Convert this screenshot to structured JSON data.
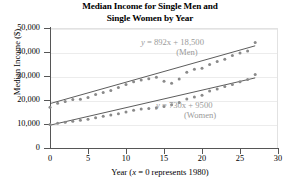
{
  "chart_data": {
    "type": "scatter",
    "title": "Median Income for Single Men and Single Women by Year",
    "title_line1": "Median Income for Single Men and",
    "title_line2": "Single Women by Year",
    "xlabel_prefix": "Year (",
    "xlabel_var": "x",
    "xlabel_suffix": " = 0 represents 1980)",
    "ylabel": "Median Income ($)",
    "xlim": [
      0,
      30
    ],
    "ylim": [
      0,
      50000
    ],
    "xticks": [
      0,
      5,
      10,
      15,
      20,
      25,
      30
    ],
    "xtick_labels": [
      "0",
      "5",
      "10",
      "15",
      "20",
      "25",
      "30"
    ],
    "yticks": [
      0,
      10000,
      20000,
      30000,
      40000,
      50000
    ],
    "ytick_labels": [
      "0",
      "10,000",
      "20,000",
      "30,000",
      "40,000",
      "50,000"
    ],
    "grid": true,
    "legend": "none",
    "marker_color": "#8a8a8a",
    "line_color": "#4a4a4a",
    "annotation_color": "#9a9a9a",
    "series": [
      {
        "name": "Men",
        "equation_lhs": "y",
        "equation_rhs": " = 892x + 18,500",
        "equation_text": "y = 892x + 18,500",
        "label": "(Men)",
        "slope": 892,
        "intercept": 18500,
        "x": [
          0,
          1,
          2,
          3,
          4,
          5,
          6,
          7,
          8,
          9,
          10,
          11,
          12,
          13,
          14,
          15,
          16,
          17,
          18,
          19,
          20,
          21,
          22,
          23,
          24,
          25,
          26,
          27
        ],
        "y": [
          17000,
          18600,
          19400,
          20200,
          20300,
          21000,
          22300,
          23100,
          24000,
          25200,
          26500,
          27600,
          28300,
          28900,
          29500,
          27800,
          27000,
          28700,
          31600,
          32800,
          33200,
          34800,
          36000,
          37000,
          38500,
          39600,
          40400,
          44000
        ]
      },
      {
        "name": "Women",
        "equation_lhs": "y",
        "equation_rhs": " = 730x + 9500",
        "equation_text": "y = 730x + 9500",
        "label": "(Women)",
        "slope": 730,
        "intercept": 9500,
        "x": [
          0,
          1,
          2,
          3,
          4,
          5,
          6,
          7,
          8,
          9,
          10,
          11,
          12,
          13,
          14,
          15,
          16,
          17,
          18,
          19,
          20,
          21,
          22,
          23,
          24,
          25,
          26,
          27
        ],
        "y": [
          9800,
          10300,
          10700,
          11100,
          11600,
          12000,
          12600,
          13200,
          13800,
          14300,
          15000,
          15700,
          16200,
          16500,
          16800,
          17300,
          18000,
          19000,
          20400,
          21300,
          22000,
          23700,
          24600,
          25600,
          26500,
          27600,
          28500,
          30600
        ]
      }
    ]
  }
}
